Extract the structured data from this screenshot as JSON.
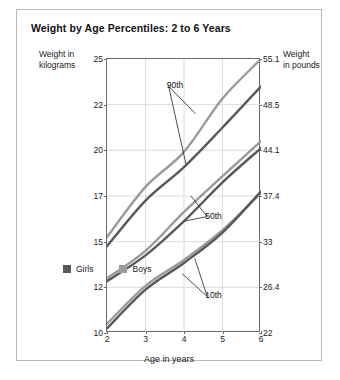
{
  "figure": {
    "title": "Weight by Age Percentiles: 2 to 6 Years",
    "left_caption_line1": "Weight in",
    "left_caption_line2": "kilograms",
    "right_caption_line1": "Weight",
    "right_caption_line2": "in pounds",
    "xlabel": "Age in years"
  },
  "colors": {
    "girls": "#595959",
    "boys": "#9a9a9a",
    "axis": "#6a6a6a",
    "grid": "#dcdcdc",
    "border": "#b9b9b9",
    "text": "#1a1a1a"
  },
  "legend": {
    "position": "inside-bottom-center",
    "items": [
      {
        "label": "Girls",
        "color": "#595959"
      },
      {
        "label": "Boys",
        "color": "#9a9a9a"
      }
    ]
  },
  "annotations": [
    {
      "text": "90th",
      "x": 3.55,
      "y": 23.2
    },
    {
      "text": "50th",
      "x": 4.55,
      "y": 16.1
    },
    {
      "text": "10th",
      "x": 4.55,
      "y": 11.6
    }
  ],
  "chart_data": {
    "type": "line",
    "title": "Weight by Age Percentiles: 2 to 6 Years",
    "xlabel": "Age in years",
    "ylabel": "Weight in kilograms",
    "ylabel_right": "Weight in pounds",
    "grid": true,
    "xlim": [
      2,
      6
    ],
    "ylim": [
      10,
      25
    ],
    "x": [
      2,
      3,
      4,
      5,
      6
    ],
    "xticks": [
      2,
      3,
      4,
      5,
      6
    ],
    "yticks_kg": [
      10,
      12,
      15,
      17,
      20,
      22,
      25
    ],
    "yticks_lb": [
      22.0,
      26.4,
      33.0,
      37.4,
      44.1,
      48.5,
      55.1
    ],
    "series": [
      {
        "name": "Boys 90th",
        "percentile": "90th",
        "sex": "Boys",
        "color": "#9a9a9a",
        "values": [
          15.2,
          17.6,
          19.9,
          22.4,
          25.0
        ]
      },
      {
        "name": "Girls 90th",
        "percentile": "90th",
        "sex": "Girls",
        "color": "#595959",
        "values": [
          14.7,
          16.8,
          18.9,
          21.0,
          23.2
        ]
      },
      {
        "name": "Boys 50th",
        "percentile": "50th",
        "sex": "Boys",
        "color": "#9a9a9a",
        "values": [
          12.6,
          14.4,
          16.3,
          18.3,
          20.4
        ]
      },
      {
        "name": "Girls 50th",
        "percentile": "50th",
        "sex": "Girls",
        "color": "#595959",
        "values": [
          12.4,
          14.1,
          15.9,
          17.9,
          20.1
        ]
      },
      {
        "name": "Boys 10th",
        "percentile": "10th",
        "sex": "Boys",
        "color": "#9a9a9a",
        "values": [
          10.4,
          12.1,
          13.8,
          15.5,
          17.2
        ]
      },
      {
        "name": "Girls 10th",
        "percentile": "10th",
        "sex": "Girls",
        "color": "#595959",
        "values": [
          10.2,
          11.9,
          13.6,
          15.4,
          17.3
        ]
      }
    ]
  }
}
